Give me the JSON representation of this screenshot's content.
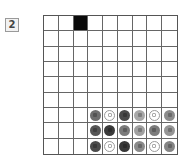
{
  "puzzle": {
    "number_label": "2",
    "rows": 9,
    "cols": 9,
    "filled_cells": [
      [
        0,
        2
      ]
    ],
    "pieces": [
      {
        "r": 6,
        "c": 3,
        "kind": "solid",
        "color": "#6e6e6e"
      },
      {
        "r": 6,
        "c": 4,
        "kind": "ring",
        "color": "#ffffff"
      },
      {
        "r": 6,
        "c": 5,
        "kind": "solid",
        "color": "#4a4a4a"
      },
      {
        "r": 6,
        "c": 6,
        "kind": "solid",
        "color": "#a8a8a8"
      },
      {
        "r": 6,
        "c": 7,
        "kind": "ring",
        "color": "#ffffff"
      },
      {
        "r": 6,
        "c": 8,
        "kind": "solid",
        "color": "#8c8c8c"
      },
      {
        "r": 7,
        "c": 3,
        "kind": "solid",
        "color": "#555555"
      },
      {
        "r": 7,
        "c": 4,
        "kind": "solid",
        "color": "#3a3a3a"
      },
      {
        "r": 7,
        "c": 5,
        "kind": "solid",
        "color": "#7a7a7a"
      },
      {
        "r": 7,
        "c": 6,
        "kind": "solid",
        "color": "#a0a0a0"
      },
      {
        "r": 7,
        "c": 7,
        "kind": "solid",
        "color": "#7c7c7c"
      },
      {
        "r": 7,
        "c": 8,
        "kind": "solid",
        "color": "#959595"
      },
      {
        "r": 8,
        "c": 3,
        "kind": "solid",
        "color": "#4c4c4c"
      },
      {
        "r": 8,
        "c": 4,
        "kind": "ring",
        "color": "#ffffff"
      },
      {
        "r": 8,
        "c": 5,
        "kind": "solid",
        "color": "#383838"
      },
      {
        "r": 8,
        "c": 6,
        "kind": "solid",
        "color": "#8a8a8a"
      },
      {
        "r": 8,
        "c": 7,
        "kind": "ring",
        "color": "#ffffff"
      },
      {
        "r": 8,
        "c": 8,
        "kind": "solid",
        "color": "#858585"
      }
    ]
  }
}
